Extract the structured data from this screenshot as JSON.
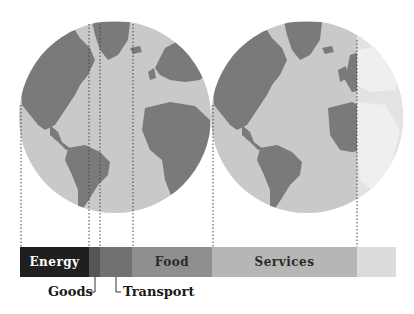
{
  "figure": {
    "globes": [
      {
        "name": "left-globe",
        "cx": 115,
        "cy": 117,
        "r": 96
      },
      {
        "name": "right-globe",
        "cx": 307,
        "cy": 117,
        "r": 96
      }
    ],
    "colors": {
      "ocean": "#c9c9c9",
      "land": "#7a7a7a",
      "faded_ocean": "#e2e2e2",
      "faded_land": "#ececec"
    }
  },
  "segments": [
    {
      "label": "Energy",
      "x0": 20,
      "x1": 89,
      "color": "#1f1f1f",
      "text_color": "#ffffff"
    },
    {
      "label": "",
      "name": "Goods",
      "x0": 89,
      "x1": 100,
      "color": "#555555",
      "text_color": "#222222"
    },
    {
      "label": "",
      "name": "Transport",
      "x0": 100,
      "x1": 132,
      "color": "#717171",
      "text_color": "#222222"
    },
    {
      "label": "Food",
      "x0": 132,
      "x1": 212,
      "color": "#8f8f8f",
      "text_color": "#2a2a2a"
    },
    {
      "label": "Services",
      "x0": 212,
      "x1": 357,
      "color": "#b6b6b6",
      "text_color": "#2a2a2a"
    },
    {
      "label": "",
      "name": "Other",
      "x0": 357,
      "x1": 396,
      "color": "#dcdcdc",
      "text_color": "#2a2a2a"
    }
  ],
  "callouts": {
    "goods": "Goods",
    "transport": "Transport"
  },
  "guides_x": [
    20,
    89,
    100,
    132,
    212,
    357
  ]
}
